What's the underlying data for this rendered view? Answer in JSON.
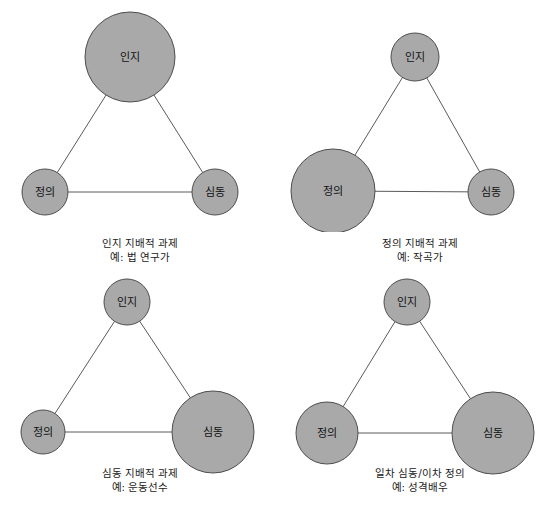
{
  "figure": {
    "width": 560,
    "height": 521,
    "background": "#ffffff",
    "node_fill": "#a9a9a9",
    "node_stroke": "#4d4d4d",
    "edge_color": "#5a5a5a"
  },
  "panels": [
    {
      "id": "panel-cognitive-dominant",
      "caption_title": "인지 지배적 과제",
      "caption_example": "예: 법 연구가",
      "nodes": [
        {
          "name": "인지",
          "cx": 130,
          "cy": 57,
          "r": 45,
          "size": "large"
        },
        {
          "name": "정의",
          "cx": 45,
          "cy": 192,
          "r": 23,
          "size": "small"
        },
        {
          "name": "심동",
          "cx": 215,
          "cy": 192,
          "r": 23,
          "size": "small"
        }
      ],
      "edges": [
        {
          "from": "인지",
          "to": "정의"
        },
        {
          "from": "인지",
          "to": "심동"
        },
        {
          "from": "정의",
          "to": "심동"
        }
      ]
    },
    {
      "id": "panel-affective-dominant",
      "caption_title": "정의 지배적 과제",
      "caption_example": "예: 작곡가",
      "nodes": [
        {
          "name": "인지",
          "cx": 135,
          "cy": 57,
          "r": 24,
          "size": "small"
        },
        {
          "name": "정의",
          "cx": 53,
          "cy": 191,
          "r": 42,
          "size": "large"
        },
        {
          "name": "심동",
          "cx": 211,
          "cy": 192,
          "r": 23,
          "size": "small"
        }
      ],
      "edges": [
        {
          "from": "인지",
          "to": "정의"
        },
        {
          "from": "인지",
          "to": "심동"
        },
        {
          "from": "정의",
          "to": "심동"
        }
      ]
    },
    {
      "id": "panel-psychomotor-dominant",
      "caption_title": "심동 지배적 과제",
      "caption_example": "예: 운동선수",
      "nodes": [
        {
          "name": "인지",
          "cx": 127,
          "cy": 32,
          "r": 23,
          "size": "small"
        },
        {
          "name": "정의",
          "cx": 43,
          "cy": 162,
          "r": 22,
          "size": "small"
        },
        {
          "name": "심동",
          "cx": 213,
          "cy": 162,
          "r": 41,
          "size": "large"
        }
      ],
      "edges": [
        {
          "from": "인지",
          "to": "정의"
        },
        {
          "from": "인지",
          "to": "심동"
        },
        {
          "from": "정의",
          "to": "심동"
        }
      ]
    },
    {
      "id": "panel-primary-psychomotor-secondary-affective",
      "caption_title": "일차 심동/이차 정의",
      "caption_example": "예: 성격배우",
      "nodes": [
        {
          "name": "인지",
          "cx": 127,
          "cy": 32,
          "r": 23,
          "size": "small"
        },
        {
          "name": "정의",
          "cx": 47,
          "cy": 163,
          "r": 31,
          "size": "medium"
        },
        {
          "name": "심동",
          "cx": 213,
          "cy": 163,
          "r": 41,
          "size": "large"
        }
      ],
      "edges": [
        {
          "from": "인지",
          "to": "정의"
        },
        {
          "from": "인지",
          "to": "심동"
        },
        {
          "from": "정의",
          "to": "심동"
        }
      ]
    }
  ]
}
